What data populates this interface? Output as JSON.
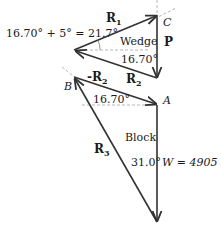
{
  "diagram": {
    "wedge": {
      "label": "Wedge",
      "vectors": {
        "R1": {
          "name": "R",
          "sub": "1"
        },
        "P": {
          "name": "P"
        },
        "R2": {
          "name": "R",
          "sub": "2"
        }
      },
      "angle_top": "16.70° + 5° = 21.7°",
      "angle_bottom": "16.70°",
      "point": "C"
    },
    "block": {
      "label": "Block",
      "vectors": {
        "negR2": {
          "name": "-R",
          "sub": "2"
        },
        "R3": {
          "name": "R",
          "sub": "3"
        },
        "W": "W = 4905 N"
      },
      "angle_top": "16.70°",
      "angle_bottom": "31.0°",
      "point_left": "B",
      "point_right": "A"
    }
  }
}
